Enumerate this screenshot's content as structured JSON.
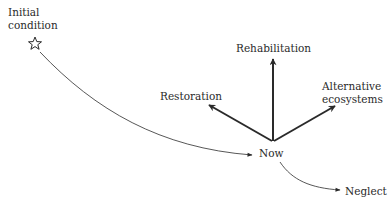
{
  "diagram": {
    "nodes": {
      "initial": {
        "label_line1": "Initial",
        "label_line2": "condition",
        "marker": "star-icon"
      },
      "now": {
        "label": "Now"
      },
      "rehabilitation": {
        "label": "Rehabilitation"
      },
      "restoration": {
        "label": "Restoration"
      },
      "alternative": {
        "label_line1": "Alternative",
        "label_line2": "ecosystems"
      },
      "neglect": {
        "label": "Neglect"
      }
    },
    "edges": [
      {
        "from": "Initial condition",
        "to": "Now",
        "style": "thin curved arrow"
      },
      {
        "from": "Now",
        "to": "Rehabilitation",
        "style": "bold straight arrow"
      },
      {
        "from": "Now",
        "to": "Restoration",
        "style": "bold straight arrow"
      },
      {
        "from": "Now",
        "to": "Alternative ecosystems",
        "style": "bold straight arrow"
      },
      {
        "from": "Now",
        "to": "Neglect",
        "style": "thin curved arrow"
      }
    ],
    "colors": {
      "ink": "#2a2a2a"
    }
  }
}
